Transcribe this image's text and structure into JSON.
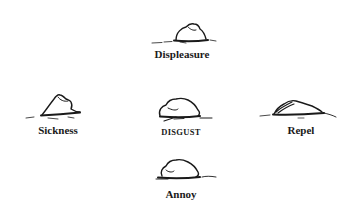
{
  "diagram": {
    "type": "radial-concept-sketch",
    "center": {
      "label": "DISGUST",
      "icon": "mound-sketch-icon"
    },
    "nodes": [
      {
        "id": "top",
        "label": "Displeasure",
        "icon": "mound-sketch-icon"
      },
      {
        "id": "left",
        "label": "Sickness",
        "icon": "peaked-mound-sketch-icon"
      },
      {
        "id": "right",
        "label": "Repel",
        "icon": "flattened-mound-sketch-icon"
      },
      {
        "id": "bottom",
        "label": "Annoy",
        "icon": "low-mound-sketch-icon"
      }
    ],
    "colors": {
      "background": "#ffffff",
      "ink": "#1a1a1a"
    }
  }
}
